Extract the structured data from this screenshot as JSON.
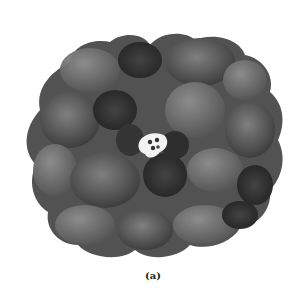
{
  "figure": {
    "panel_label": "(a)",
    "colors": {
      "background": "#ffffff",
      "surface_light": "#8a8a8a",
      "surface_mid": "#5e5e5e",
      "surface_dark": "#2e2e2e",
      "ligand_highlight": "#f4f4f4"
    }
  }
}
